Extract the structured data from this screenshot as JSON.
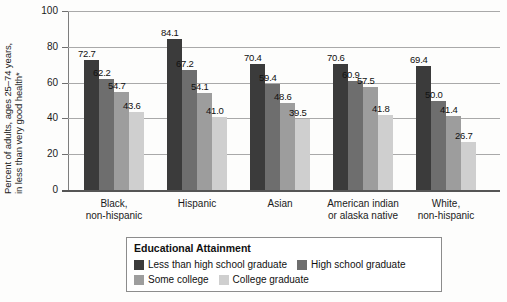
{
  "chart_data": {
    "type": "bar",
    "title": "",
    "xlabel": "",
    "ylabel_line1": "Percent of adults, ages 25–74 years,",
    "ylabel_line2": "in less than very good health*",
    "ylim": [
      0,
      100
    ],
    "yticks": [
      "0",
      "20",
      "40",
      "60",
      "80",
      "100"
    ],
    "grid": true,
    "legend_position": "bottom",
    "legend_title": "Educational Attainment",
    "categories": [
      "Black,\nnon-hispanic",
      "Hispanic",
      "Asian",
      "American indian\nor alaska native",
      "White,\nnon-hispanic"
    ],
    "category_lines": [
      [
        "Black,",
        "non-hispanic"
      ],
      [
        "Hispanic",
        ""
      ],
      [
        "Asian",
        ""
      ],
      [
        "American indian",
        "or alaska native"
      ],
      [
        "White,",
        "non-hispanic"
      ]
    ],
    "series": [
      {
        "name": "Less than high school graduate",
        "color": "#3b3b3b",
        "values": [
          72.7,
          84.1,
          70.4,
          70.6,
          69.4
        ],
        "labels": [
          "72.7",
          "84.1",
          "70.4",
          "70.6",
          "69.4"
        ]
      },
      {
        "name": "High school graduate",
        "color": "#6e6e6e",
        "values": [
          62.2,
          67.2,
          59.4,
          60.9,
          50.0
        ],
        "labels": [
          "62.2",
          "67.2",
          "59.4",
          "60.9",
          "50.0"
        ]
      },
      {
        "name": "Some college",
        "color": "#9d9d9d",
        "values": [
          54.7,
          54.1,
          48.6,
          57.5,
          41.4
        ],
        "labels": [
          "54.7",
          "54.1",
          "48.6",
          "57.5",
          "41.4"
        ]
      },
      {
        "name": "College graduate",
        "color": "#cfcfcf",
        "values": [
          43.6,
          41.0,
          39.5,
          41.8,
          26.7
        ],
        "labels": [
          "43.6",
          "41.0",
          "39.5",
          "41.8",
          "26.7"
        ]
      }
    ]
  }
}
